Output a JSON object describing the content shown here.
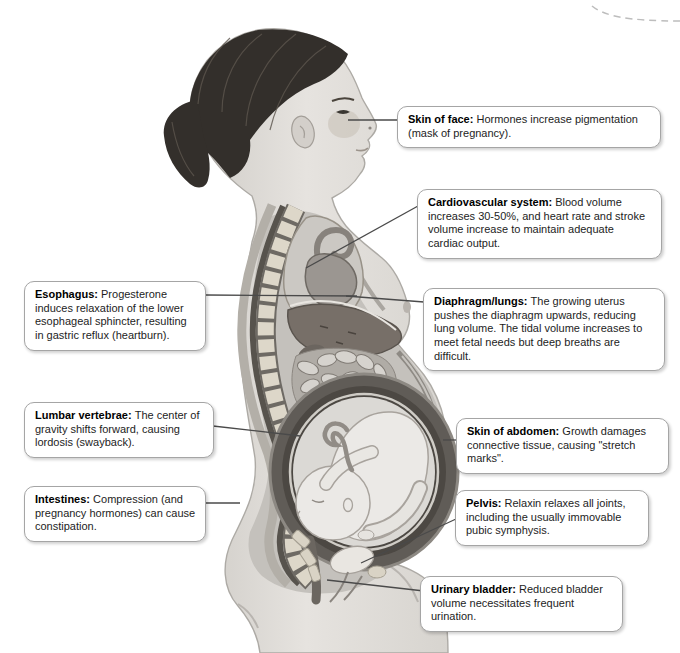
{
  "illustration": {
    "subject": "Sagittal cutaway illustration of a pregnant woman in profile facing right showing changes of pregnancy",
    "parts": [
      "hair-ponytail",
      "face-with-pregnancy-mask",
      "ear",
      "breast",
      "spine-vertebrae",
      "lungs",
      "heart-and-aorta",
      "liver",
      "stomach",
      "intestines",
      "uterus",
      "fetus-head-down",
      "umbilical-cord",
      "sacrum",
      "urinary-bladder",
      "pubic-symphysis",
      "rectum",
      "thigh"
    ],
    "decor": "partial dashed callout border at top-right corner"
  },
  "colors": {
    "background": "#ffffff",
    "callout_bg": "#ffffff",
    "callout_border": "#a5a5a5",
    "leader_line": "#4a4a4a",
    "title_text": "#000000",
    "body_text": "#1d1d1d",
    "skin": "#dedbd6",
    "hair": "#332f2b",
    "vertebrae": "#ddd7c9",
    "liver": "#776f68",
    "uterus_wall": "#4c4843",
    "fetus": "#ebe9e6"
  },
  "callouts": [
    {
      "id": "skin-of-face",
      "title": "Skin of face:",
      "text": "Hormones increase pigmentation (mask of pregnancy)."
    },
    {
      "id": "cardiovascular-system",
      "title": "Cardiovascular system:",
      "text": "Blood volume increases 30-50%, and heart rate and stroke volume increase to maintain adequate cardiac output."
    },
    {
      "id": "esophagus",
      "title": "Esophagus:",
      "text": "Progesterone induces relaxation of the lower esophageal sphincter, resulting in gastric reflux (heartburn)."
    },
    {
      "id": "diaphragm-lungs",
      "title": "Diaphragm/lungs:",
      "text": "The growing uterus pushes the diaphragm upwards, reducing lung volume. The tidal volume increases to meet fetal needs but deep breaths are difficult."
    },
    {
      "id": "lumbar-vertebrae",
      "title": "Lumbar vertebrae:",
      "text": "The center of gravity shifts forward, causing lordosis (swayback)."
    },
    {
      "id": "skin-of-abdomen",
      "title": "Skin of abdomen:",
      "text": "Growth damages connective tissue, causing \"stretch marks\"."
    },
    {
      "id": "intestines",
      "title": "Intestines:",
      "text": "Compression (and pregnancy hormones) can cause constipation."
    },
    {
      "id": "pelvis",
      "title": "Pelvis:",
      "text": "Relaxin relaxes all joints, including the usually immovable pubic symphysis."
    },
    {
      "id": "urinary-bladder",
      "title": "Urinary bladder:",
      "text": "Reduced bladder volume necessitates frequent urination."
    }
  ]
}
